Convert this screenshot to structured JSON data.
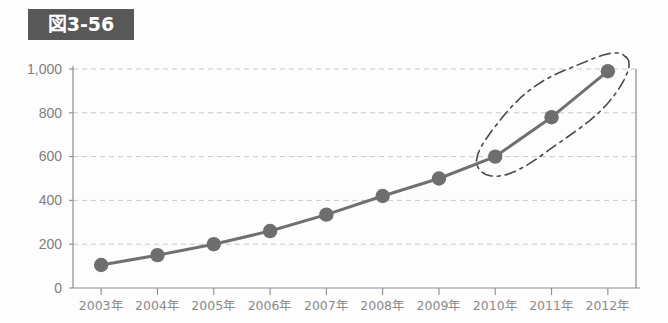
{
  "title": {
    "label": "図3-56"
  },
  "chart_data": {
    "type": "line",
    "title": "図3-56",
    "xlabel": "",
    "ylabel": "",
    "categories": [
      "2003年",
      "2004年",
      "2005年",
      "2006年",
      "2007年",
      "2008年",
      "2009年",
      "2010年",
      "2011年",
      "2012年"
    ],
    "values": [
      105,
      150,
      200,
      260,
      335,
      420,
      500,
      600,
      780,
      990
    ],
    "series": [
      {
        "name": "series-1",
        "values": [
          105,
          150,
          200,
          260,
          335,
          420,
          500,
          600,
          780,
          990
        ]
      }
    ],
    "ylim": [
      0,
      1000
    ],
    "ytick_values": [
      0,
      200,
      400,
      600,
      800,
      1000
    ],
    "ytick_labels": [
      "0",
      "200",
      "400",
      "600",
      "800",
      "1,000"
    ],
    "grid": true,
    "grid_axis": "y",
    "legend": false,
    "legend_position": "none",
    "annotations": [
      {
        "type": "ellipse",
        "style": "hand-drawn-dashed",
        "covers": [
          "2010年",
          "2011年",
          "2012年"
        ],
        "label": ""
      }
    ]
  },
  "colors": {
    "title_badge_bg": "#585858",
    "title_badge_text": "#ffffff",
    "line": "#707070",
    "marker": "#6e6e6e",
    "gridline": "#c9c9c9",
    "axis": "#8d8d8d",
    "tick_label": "#8a8a8a",
    "annotation": "#4a4a4a",
    "background": "#fdfdfd"
  }
}
